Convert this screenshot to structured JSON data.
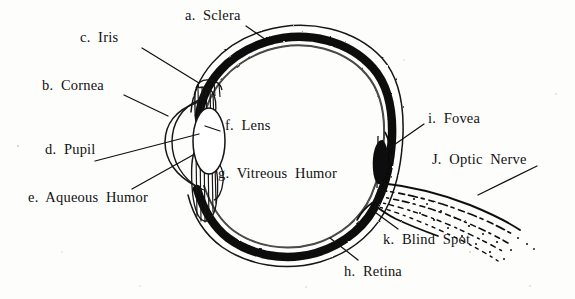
{
  "diagram": {
    "background_color": "#fdfdfc",
    "ink_color": "#111111",
    "labels": [
      {
        "key": "a.",
        "name": "Sclera",
        "text": "a.  Sclera",
        "x": 185,
        "y": 8,
        "leader": [
          [
            246,
            26
          ],
          [
            272,
            44
          ]
        ]
      },
      {
        "key": "c.",
        "name": "Iris",
        "text": "c.  Iris",
        "x": 80,
        "y": 30,
        "leader": [
          [
            142,
            48
          ],
          [
            199,
            83
          ]
        ]
      },
      {
        "key": "b.",
        "name": "Cornea",
        "text": "b.  Cornea",
        "x": 42,
        "y": 78,
        "leader": [
          [
            124,
            95
          ],
          [
            168,
            116
          ]
        ]
      },
      {
        "key": "f.",
        "name": "Lens",
        "text": "f.  Lens",
        "x": 225,
        "y": 118,
        "leader": [
          [
            220,
            131
          ],
          [
            205,
            126
          ]
        ]
      },
      {
        "key": "i.",
        "name": "Fovea",
        "text": "i.  Fovea",
        "x": 428,
        "y": 111,
        "leader": [
          [
            424,
            124
          ],
          [
            381,
            154
          ]
        ]
      },
      {
        "key": "d.",
        "name": "Pupil",
        "text": "d.  Pupil",
        "x": 45,
        "y": 142,
        "leader": [
          [
            95,
            161
          ],
          [
            199,
            134
          ]
        ]
      },
      {
        "key": "J.",
        "name": "Optic Nerve",
        "text": "J.  Optic  Nerve",
        "x": 432,
        "y": 152,
        "leader": [
          [
            537,
            166
          ],
          [
            478,
            195
          ]
        ]
      },
      {
        "key": "g.",
        "name": "Vitreous Humor",
        "text": "g.  Vitreous  Humor",
        "x": 218,
        "y": 166,
        "leader": null
      },
      {
        "key": "e.",
        "name": "Aqueous Humor",
        "text": "e.  Aqueous  Humor",
        "x": 28,
        "y": 190,
        "leader": [
          [
            132,
            189
          ],
          [
            193,
            155
          ]
        ]
      },
      {
        "key": "k.",
        "name": "Blind Spot",
        "text": "k.  Blind  Spot",
        "x": 383,
        "y": 232,
        "leader": [
          [
            398,
            229
          ],
          [
            372,
            210
          ]
        ]
      },
      {
        "key": "h.",
        "name": "Retina",
        "text": "h.  Retina",
        "x": 344,
        "y": 264,
        "leader": [
          [
            358,
            260
          ],
          [
            330,
            238
          ]
        ]
      }
    ],
    "structures": [
      "sclera-outer-outline",
      "retina-black-band",
      "cornea-arc",
      "iris-ciliary-upper",
      "iris-ciliary-lower",
      "lens-oval",
      "fovea-bulge",
      "optic-nerve-fibers",
      "blind-spot-notch"
    ]
  }
}
